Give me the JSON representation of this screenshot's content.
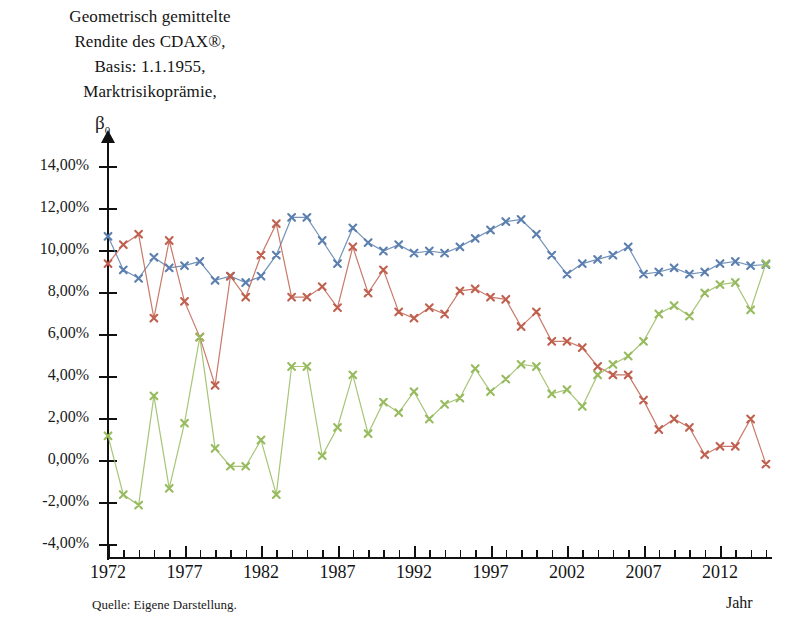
{
  "title": {
    "lines": [
      "Geometrisch gemittelte",
      "Rendite des CDAX®,",
      "Basis: 1.1.1955,",
      "Marktrisikoprämie,"
    ],
    "axis_symbol": "β",
    "axis_symbol_sub": "0"
  },
  "footer": {
    "source": "Quelle: Eigene Darstellung.",
    "x_axis_name": "Jahr"
  },
  "colors": {
    "blue": "#5b7fae",
    "orange": "#c0604f",
    "green": "#97bb5e",
    "axis": "#111111",
    "text": "#141414"
  },
  "chart_data": {
    "type": "line",
    "xlabel": "Jahr",
    "ylabel": "",
    "grid": false,
    "legend": "none",
    "xlim": [
      1972,
      2015
    ],
    "ylim": [
      -4,
      14
    ],
    "ytick_labels": [
      "14,00%",
      "12,00%",
      "10,00%",
      "8,00%",
      "6,00%",
      "4,00%",
      "2,00%",
      "0,00%",
      "-2,00%",
      "-4,00%"
    ],
    "ytick_values": [
      14,
      12,
      10,
      8,
      6,
      4,
      2,
      0,
      -2,
      -4
    ],
    "xtick_labels": [
      "1972",
      "1977",
      "1982",
      "1987",
      "1992",
      "1997",
      "2002",
      "2007",
      "2012"
    ],
    "xtick_values": [
      1972,
      1977,
      1982,
      1987,
      1992,
      1997,
      2002,
      2007,
      2012
    ],
    "x": [
      1972,
      1973,
      1974,
      1975,
      1976,
      1977,
      1978,
      1979,
      1980,
      1981,
      1982,
      1983,
      1984,
      1985,
      1986,
      1987,
      1988,
      1989,
      1990,
      1991,
      1992,
      1993,
      1994,
      1995,
      1996,
      1997,
      1998,
      1999,
      2000,
      2001,
      2002,
      2003,
      2004,
      2005,
      2006,
      2007,
      2008,
      2009,
      2010,
      2011,
      2012,
      2013,
      2014,
      2015
    ],
    "series": [
      {
        "name": "Geometrisch gemittelte Rendite des CDAX®",
        "color": "#5b7fae",
        "marker": "x",
        "values": [
          10.7,
          9.1,
          8.7,
          9.7,
          9.2,
          9.3,
          9.5,
          8.6,
          8.8,
          8.5,
          8.8,
          9.8,
          11.6,
          11.6,
          10.5,
          9.4,
          11.1,
          10.4,
          10.0,
          10.3,
          9.9,
          10.0,
          9.9,
          10.2,
          10.6,
          11.0,
          11.4,
          11.5,
          10.8,
          9.8,
          8.9,
          9.4,
          9.6,
          9.8,
          10.2,
          8.9,
          9.0,
          9.2,
          8.9,
          9.0,
          9.4,
          9.5,
          9.3,
          9.35
        ]
      },
      {
        "name": "Marktrisikoprämie",
        "color": "#c0604f",
        "marker": "x",
        "values": [
          9.4,
          10.3,
          10.8,
          6.8,
          10.5,
          7.6,
          5.9,
          3.6,
          8.8,
          7.8,
          9.8,
          11.3,
          7.8,
          7.8,
          8.3,
          7.3,
          10.2,
          8.0,
          9.1,
          7.1,
          6.8,
          7.3,
          7.0,
          8.1,
          8.2,
          7.8,
          7.7,
          6.4,
          7.1,
          5.7,
          5.7,
          5.4,
          4.5,
          4.1,
          4.1,
          2.9,
          1.5,
          2.0,
          1.6,
          0.3,
          0.7,
          0.7,
          2.0,
          -0.15
        ]
      },
      {
        "name": "β₀",
        "color": "#97bb5e",
        "marker": "x",
        "values": [
          1.2,
          -1.6,
          -2.1,
          3.1,
          -1.3,
          1.8,
          5.9,
          0.6,
          -0.25,
          -0.25,
          1.0,
          -1.6,
          4.5,
          4.5,
          0.25,
          1.6,
          4.1,
          1.3,
          2.8,
          2.3,
          3.3,
          2.0,
          2.7,
          3.0,
          4.4,
          3.3,
          3.9,
          4.6,
          4.5,
          3.2,
          3.4,
          2.6,
          4.1,
          4.6,
          5.0,
          5.7,
          7.0,
          7.4,
          6.9,
          8.0,
          8.4,
          8.5,
          7.2,
          9.4
        ]
      }
    ]
  }
}
